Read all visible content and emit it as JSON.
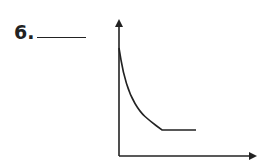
{
  "question": {
    "number_label": "6.",
    "answer_blank": ""
  },
  "chart_data": {
    "type": "line",
    "title": "",
    "xlabel": "",
    "ylabel": "",
    "grid": false,
    "legend": null,
    "series": [
      {
        "name": "curve",
        "points_px": [
          [
            119,
            48
          ],
          [
            123,
            72
          ],
          [
            130,
            95
          ],
          [
            140,
            112
          ],
          [
            150,
            121
          ],
          [
            162,
            130
          ],
          [
            196,
            130
          ]
        ]
      }
    ],
    "axes": {
      "origin_px": [
        119,
        156
      ],
      "y_axis_top_px": [
        119,
        18
      ],
      "x_axis_right_px": [
        258,
        156
      ],
      "arrows": true
    },
    "colors": {
      "ink": "#222222"
    }
  }
}
